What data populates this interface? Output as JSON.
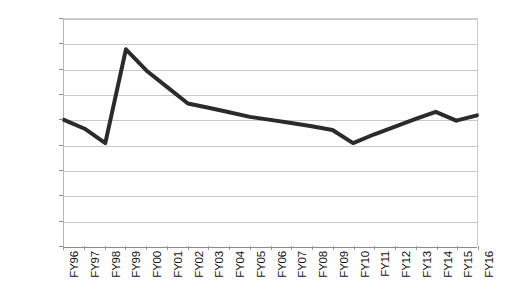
{
  "chart_data": {
    "type": "line",
    "title": "",
    "subtitle": "",
    "xlabel": "",
    "ylabel": "",
    "categories": [
      "FY96",
      "FY97",
      "FY98",
      "FY99",
      "FY00",
      "FY01",
      "FY02",
      "FY03",
      "FY04",
      "FY05",
      "FY06",
      "FY07",
      "FY08",
      "FY09",
      "FY10",
      "FY11",
      "FY12",
      "FY13",
      "FY14",
      "FY15",
      "FY16"
    ],
    "values": [
      5000,
      4650,
      4080,
      7800,
      6950,
      6300,
      5650,
      5480,
      5300,
      5120,
      5000,
      4880,
      4750,
      4600,
      4080,
      4420,
      4720,
      5030,
      5320,
      4970,
      5180
    ],
    "series": [
      {
        "name": "",
        "values": [
          5000,
          4650,
          4080,
          7800,
          6950,
          6300,
          5650,
          5480,
          5300,
          5120,
          5000,
          4880,
          4750,
          4600,
          4080,
          4420,
          4720,
          5030,
          5320,
          4970,
          5180
        ]
      }
    ],
    "ytick_labels": [
      "9,000",
      "8,000",
      "7,000",
      "6,000",
      "5,000",
      "4,000",
      "3,000",
      "2,000",
      "1,000",
      "0"
    ],
    "ytick_values": [
      9000,
      8000,
      7000,
      6000,
      5000,
      4000,
      3000,
      2000,
      1000,
      0
    ],
    "ylim": [
      0,
      9000
    ],
    "grid": true,
    "legend": false,
    "legend_position": "none",
    "line_color": "#2b2b2b",
    "grid_color": "#c8c8c8",
    "axis_color": "#8c8c8c",
    "background_color": "#ffffff",
    "line_width": 4
  }
}
